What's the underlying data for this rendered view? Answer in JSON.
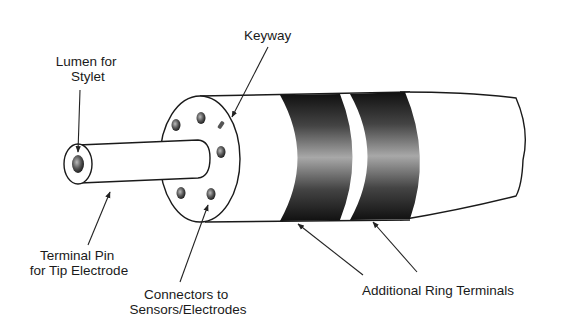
{
  "figure": {
    "labels": {
      "lumen": [
        "Lumen for",
        "Stylet"
      ],
      "keyway": [
        "Keyway"
      ],
      "terminal_pin": [
        "Terminal Pin",
        "for Tip Electrode"
      ],
      "connectors": [
        "Connectors to",
        "Sensors/Electrodes"
      ],
      "ring_terminals": [
        "Additional Ring Terminals"
      ]
    },
    "parts": {
      "connector_count": 6,
      "ring_terminal_count": 2
    },
    "colors": {
      "ink": "#1a1a1a",
      "band_dark": "#111111",
      "band_light": "#9a9a9a",
      "background": "#ffffff"
    }
  }
}
